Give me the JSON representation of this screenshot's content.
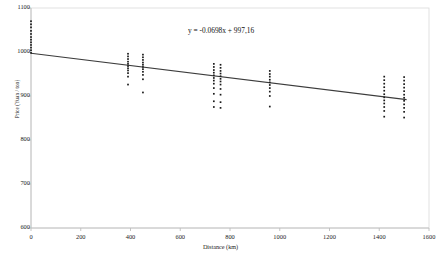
{
  "chart": {
    "equation_label": "y = -0.0698x + 997,16",
    "axis_color": "#d9d9d9",
    "point_color": "#1a1a1a",
    "trendline_color": "#3c3c3c",
    "text_color": "#222222"
  },
  "chart_data": {
    "type": "scatter",
    "title": "",
    "xlabel": "Distance (km)",
    "ylabel": "Price (Yuan / ton)",
    "xlim": [
      0,
      1600
    ],
    "ylim": [
      600,
      1100
    ],
    "xticks": [
      0,
      200,
      400,
      600,
      800,
      1000,
      1200,
      1400,
      1600
    ],
    "xtick_labels": [
      "0",
      "200",
      "400",
      "600",
      "800",
      "1000",
      "1200",
      "1400",
      "1600"
    ],
    "yticks": [
      600,
      700,
      800,
      900,
      1000,
      1100
    ],
    "ytick_labels": [
      "600",
      "700",
      "800",
      "900",
      "1000",
      "1100"
    ],
    "grid": false,
    "legend": "none",
    "annotations": [
      {
        "text": "y = -0.0698x + 997,16",
        "x": 840,
        "y": 1048
      }
    ],
    "trendline": {
      "type": "linear",
      "slope": -0.0698,
      "intercept": 997.16,
      "equation": "y = -0.0698x + 997,16",
      "x_start": 0,
      "x_end": 1510
    },
    "series": [
      {
        "name": "Price observations",
        "marker": "square",
        "points": [
          [
            0,
            998
          ],
          [
            0,
            1004
          ],
          [
            0,
            1010
          ],
          [
            0,
            1016
          ],
          [
            0,
            1022
          ],
          [
            0,
            1028
          ],
          [
            0,
            1034
          ],
          [
            0,
            1041
          ],
          [
            0,
            1048
          ],
          [
            0,
            1056
          ],
          [
            0,
            1063
          ],
          [
            0,
            1070
          ],
          [
            390,
            926
          ],
          [
            390,
            944
          ],
          [
            390,
            952
          ],
          [
            390,
            958
          ],
          [
            390,
            963
          ],
          [
            390,
            968
          ],
          [
            390,
            973
          ],
          [
            390,
            978
          ],
          [
            390,
            984
          ],
          [
            390,
            990
          ],
          [
            390,
            996
          ],
          [
            450,
            908
          ],
          [
            450,
            938
          ],
          [
            450,
            948
          ],
          [
            450,
            955
          ],
          [
            450,
            961
          ],
          [
            450,
            966
          ],
          [
            450,
            971
          ],
          [
            450,
            976
          ],
          [
            450,
            982
          ],
          [
            450,
            988
          ],
          [
            450,
            994
          ],
          [
            735,
            875
          ],
          [
            735,
            888
          ],
          [
            735,
            905
          ],
          [
            735,
            918
          ],
          [
            735,
            928
          ],
          [
            735,
            935
          ],
          [
            735,
            941
          ],
          [
            735,
            947
          ],
          [
            735,
            953
          ],
          [
            735,
            959
          ],
          [
            735,
            966
          ],
          [
            735,
            973
          ],
          [
            762,
            873
          ],
          [
            762,
            886
          ],
          [
            762,
            903
          ],
          [
            762,
            916
          ],
          [
            762,
            926
          ],
          [
            762,
            933
          ],
          [
            762,
            939
          ],
          [
            762,
            945
          ],
          [
            762,
            951
          ],
          [
            762,
            957
          ],
          [
            762,
            964
          ],
          [
            762,
            971
          ],
          [
            960,
            876
          ],
          [
            960,
            900
          ],
          [
            960,
            910
          ],
          [
            960,
            918
          ],
          [
            960,
            925
          ],
          [
            960,
            931
          ],
          [
            960,
            937
          ],
          [
            960,
            944
          ],
          [
            960,
            950
          ],
          [
            960,
            957
          ],
          [
            1420,
            853
          ],
          [
            1420,
            866
          ],
          [
            1420,
            875
          ],
          [
            1420,
            883
          ],
          [
            1420,
            890
          ],
          [
            1420,
            897
          ],
          [
            1420,
            904
          ],
          [
            1420,
            912
          ],
          [
            1420,
            920
          ],
          [
            1420,
            928
          ],
          [
            1420,
            936
          ],
          [
            1420,
            944
          ],
          [
            1500,
            851
          ],
          [
            1500,
            864
          ],
          [
            1500,
            873
          ],
          [
            1500,
            881
          ],
          [
            1500,
            889
          ],
          [
            1500,
            896
          ],
          [
            1500,
            903
          ],
          [
            1500,
            911
          ],
          [
            1500,
            919
          ],
          [
            1500,
            927
          ],
          [
            1500,
            935
          ],
          [
            1500,
            943
          ]
        ]
      }
    ]
  }
}
